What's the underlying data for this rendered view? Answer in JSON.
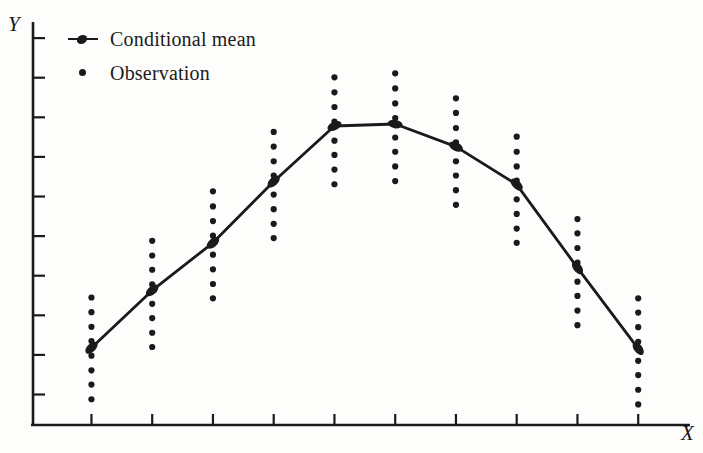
{
  "figure": {
    "title": "",
    "xlabel": "X",
    "ylabel": "Y"
  },
  "legend": {
    "position": "top-left",
    "items": [
      {
        "key": "line-marker",
        "label": "Conditional mean",
        "name": "legend-conditional-mean"
      },
      {
        "key": "dot",
        "label": "Observation",
        "name": "legend-observation"
      }
    ]
  },
  "chart_data": {
    "type": "scatter",
    "title": "",
    "xlabel": "X",
    "ylabel": "Y",
    "grid": false,
    "legend_position": "top-left",
    "axis": {
      "x_ticks_count": 10,
      "y_ticks_count": 10,
      "x_tick_labels": [],
      "y_tick_labels": [],
      "xlim": [
        0,
        11
      ],
      "ylim": [
        0,
        10
      ]
    },
    "series": [
      {
        "name": "Conditional mean",
        "type": "line",
        "marker": "line-marker",
        "x": [
          1,
          2,
          3,
          4,
          5,
          6,
          7,
          8,
          9,
          10
        ],
        "values": [
          1.95,
          3.4,
          4.6,
          6.15,
          7.55,
          7.6,
          7.03,
          6.07,
          3.97,
          1.93
        ]
      },
      {
        "name": "Observation",
        "type": "scatter",
        "marker": "dot",
        "groups": [
          {
            "x": 1,
            "y": [
              3.22,
              2.85,
              2.48,
              2.12,
              1.75,
              1.38,
              1.02,
              0.65
            ]
          },
          {
            "x": 2,
            "y": [
              4.65,
              4.28,
              3.92,
              3.55,
              3.06,
              2.7,
              2.33,
              1.97
            ]
          },
          {
            "x": 3,
            "y": [
              5.9,
              5.52,
              5.15,
              4.78,
              4.3,
              3.93,
              3.56,
              3.2
            ]
          },
          {
            "x": 4,
            "y": [
              7.4,
              7.03,
              6.66,
              6.3,
              5.82,
              5.45,
              5.08,
              4.72
            ]
          },
          {
            "x": 5,
            "y": [
              8.78,
              8.4,
              8.03,
              7.66,
              7.18,
              6.82,
              6.45,
              6.08
            ]
          },
          {
            "x": 6,
            "y": [
              8.88,
              8.5,
              8.12,
              7.75,
              7.26,
              6.9,
              6.53,
              6.16
            ]
          },
          {
            "x": 7,
            "y": [
              8.25,
              7.88,
              7.5,
              7.14,
              6.66,
              6.3,
              5.93,
              5.56
            ]
          },
          {
            "x": 8,
            "y": [
              7.28,
              6.9,
              6.53,
              6.17,
              5.7,
              5.33,
              4.96,
              4.6
            ]
          },
          {
            "x": 9,
            "y": [
              5.2,
              4.84,
              4.47,
              4.1,
              3.62,
              3.26,
              2.89,
              2.52
            ]
          },
          {
            "x": 10,
            "y": [
              3.2,
              2.84,
              2.47,
              2.1,
              1.62,
              1.26,
              0.89,
              0.52
            ]
          }
        ]
      }
    ]
  },
  "style": {
    "ink": "#1a1a1a",
    "background": "#fdfdfc"
  }
}
